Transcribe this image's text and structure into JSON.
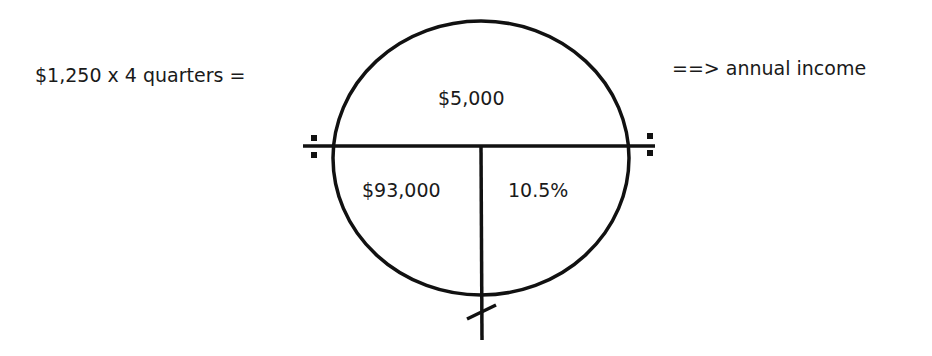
{
  "equation": {
    "left_text": "$1,250 x 4 quarters =",
    "right_text": "==> annual income"
  },
  "circle": {
    "top_value": "$5,000",
    "bottom_left_value": "$93,000",
    "bottom_right_value": "10.5%"
  },
  "colors": {
    "stroke": "#111111",
    "text": "#1a1a1a",
    "background": "#ffffff"
  }
}
